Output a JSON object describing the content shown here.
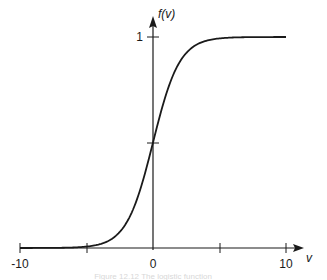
{
  "chart_data": {
    "type": "line",
    "title": "",
    "xlabel": "v",
    "ylabel": "f(v)",
    "xlim": [
      -10,
      10
    ],
    "ylim": [
      0,
      1
    ],
    "x_ticks": [
      -10,
      -5,
      0,
      5,
      10
    ],
    "x_tick_labels": [
      "-10",
      "",
      "0",
      "",
      "10"
    ],
    "y_ticks": [
      0.5,
      1
    ],
    "y_tick_labels": [
      "",
      "1"
    ],
    "grid": false,
    "legend": null,
    "series": [
      {
        "name": "f(v) = 1/(1+e^(-v))",
        "x": [
          -10,
          -8,
          -6,
          -5,
          -4,
          -3,
          -2,
          -1,
          0,
          1,
          2,
          3,
          4,
          5,
          6,
          8,
          10
        ],
        "y": [
          0.0,
          0.0003,
          0.0025,
          0.0067,
          0.018,
          0.047,
          0.119,
          0.269,
          0.5,
          0.731,
          0.881,
          0.953,
          0.982,
          0.993,
          0.9975,
          0.9997,
          1.0
        ]
      }
    ],
    "caption": "Figure 12.12 The logistic function"
  },
  "axes": {
    "x_label": "v",
    "y_label": "f(v)",
    "tick_neg10": "-10",
    "tick_0": "0",
    "tick_10": "10",
    "tick_y1": "1"
  },
  "caption": "Figure 12.12 The logistic function"
}
